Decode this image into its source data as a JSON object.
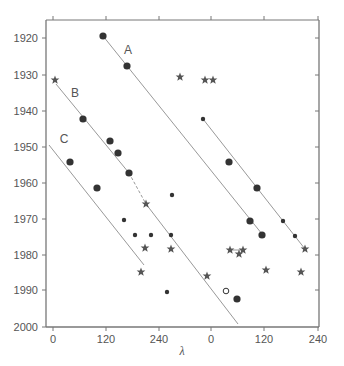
{
  "chart_data": {
    "type": "scatter",
    "title": "",
    "xlabel": "λ",
    "ylabel": "",
    "x_tick_labels": [
      "0",
      "120",
      "240",
      "0",
      "120",
      "240"
    ],
    "y_tick_labels": [
      "1920",
      "1930",
      "1940",
      "1950",
      "1960",
      "1970",
      "1980",
      "1990",
      "2000"
    ],
    "ylim": [
      2000,
      1915
    ],
    "y_inverted": true,
    "grid": false,
    "legend": null,
    "annotations": [
      "A",
      "B",
      "C"
    ],
    "frame": {
      "left": 46,
      "right": 319,
      "top": 20,
      "bottom": 327
    },
    "x_ticks_px": [
      53,
      106,
      159,
      211,
      264,
      318
    ],
    "y_ticks_px": [
      38,
      75,
      111,
      147,
      183,
      219,
      255,
      290,
      327
    ],
    "lines": [
      {
        "name": "A",
        "points_px": [
          [
            103,
            36
          ],
          [
            262,
            234
          ]
        ],
        "style": "solid"
      },
      {
        "name": "B",
        "points_px": [
          [
            56,
            84
          ],
          [
            129,
            173
          ]
        ],
        "style": "solid"
      },
      {
        "name": "B-dashed",
        "points_px": [
          [
            129,
            173
          ],
          [
            146,
            204
          ]
        ],
        "style": "dashed"
      },
      {
        "name": "B-lower",
        "points_px": [
          [
            146,
            204
          ],
          [
            238,
            324
          ]
        ],
        "style": "solid"
      },
      {
        "name": "C",
        "points_px": [
          [
            49,
            145
          ],
          [
            144,
            265
          ]
        ],
        "style": "solid"
      },
      {
        "name": "D",
        "points_px": [
          [
            203,
            119
          ],
          [
            305,
            249
          ]
        ],
        "style": "solid"
      },
      {
        "name": "star-link",
        "points_px": [
          [
            230,
            250
          ],
          [
            245,
            250
          ]
        ],
        "style": "solid"
      }
    ],
    "markers": [
      {
        "series": "A",
        "shape": "dot-large",
        "px": [
          103,
          36
        ],
        "year": 1919.5
      },
      {
        "series": "A",
        "shape": "dot-large",
        "px": [
          127,
          66
        ],
        "year": 1927.8
      },
      {
        "series": "A",
        "shape": "dot-large",
        "px": [
          250,
          221
        ],
        "year": 1970.7
      },
      {
        "series": "A",
        "shape": "dot-large",
        "px": [
          262,
          235
        ],
        "year": 1974.5
      },
      {
        "series": "B",
        "shape": "star",
        "px": [
          55,
          80
        ],
        "year": 1931.5
      },
      {
        "series": "B",
        "shape": "dot-large",
        "px": [
          83,
          119
        ],
        "year": 1942.3
      },
      {
        "series": "B",
        "shape": "dot-large",
        "px": [
          110,
          141
        ],
        "year": 1948.7
      },
      {
        "series": "B",
        "shape": "dot-large",
        "px": [
          118,
          153
        ],
        "year": 1951.9
      },
      {
        "series": "B",
        "shape": "dot-large",
        "px": [
          129,
          173
        ],
        "year": 1957.4
      },
      {
        "series": "B",
        "shape": "star",
        "px": [
          146,
          204
        ],
        "year": 1966
      },
      {
        "series": "B",
        "shape": "star",
        "px": [
          230,
          250
        ],
        "year": 1978.5
      },
      {
        "series": "B",
        "shape": "star",
        "px": [
          243,
          250
        ],
        "year": 1978.5
      },
      {
        "series": "B",
        "shape": "star",
        "px": [
          207,
          276
        ],
        "year": 1986
      },
      {
        "series": "B",
        "shape": "circle-open",
        "px": [
          226,
          291
        ],
        "year": 1990
      },
      {
        "series": "B",
        "shape": "dot-large",
        "px": [
          237,
          299
        ],
        "year": 1992.5
      },
      {
        "series": "C",
        "shape": "dot-large",
        "px": [
          70,
          162
        ],
        "year": 1954.4
      },
      {
        "series": "C",
        "shape": "dot-large",
        "px": [
          97,
          188
        ],
        "year": 1961.6
      },
      {
        "series": "C",
        "shape": "dot-small",
        "px": [
          124,
          220
        ],
        "year": 1970.4
      },
      {
        "series": "C",
        "shape": "dot-small",
        "px": [
          135,
          235
        ],
        "year": 1974.6
      },
      {
        "series": "C",
        "shape": "star",
        "px": [
          145,
          248
        ],
        "year": 1978.2
      },
      {
        "series": "other",
        "shape": "dot-small",
        "px": [
          151,
          235
        ],
        "year": 1974.6
      },
      {
        "series": "other",
        "shape": "dot-small",
        "px": [
          172,
          195
        ],
        "year": 1963.5
      },
      {
        "series": "other",
        "shape": "dot-small",
        "px": [
          171,
          235
        ],
        "year": 1974.6
      },
      {
        "series": "other",
        "shape": "star",
        "px": [
          171,
          249
        ],
        "year": 1978.5
      },
      {
        "series": "other",
        "shape": "star",
        "px": [
          141,
          272
        ],
        "year": 1985
      },
      {
        "series": "other",
        "shape": "dot-small",
        "px": [
          167,
          292
        ],
        "year": 1990.5
      },
      {
        "series": "other",
        "shape": "star",
        "px": [
          180,
          77
        ],
        "year": 1930.8
      },
      {
        "series": "other",
        "shape": "star",
        "px": [
          205,
          80
        ],
        "year": 1931.5
      },
      {
        "series": "other",
        "shape": "star",
        "px": [
          213,
          80
        ],
        "year": 1931.5
      },
      {
        "series": "D",
        "shape": "dot-small",
        "px": [
          203,
          119
        ],
        "year": 1942.5
      },
      {
        "series": "D",
        "shape": "dot-large",
        "px": [
          229,
          162
        ],
        "year": 1954.4
      },
      {
        "series": "D",
        "shape": "dot-large",
        "px": [
          257,
          188
        ],
        "year": 1961.6
      },
      {
        "series": "D",
        "shape": "dot-small",
        "px": [
          283,
          221
        ],
        "year": 1970.7
      },
      {
        "series": "D",
        "shape": "dot-small",
        "px": [
          295,
          236
        ],
        "year": 1974.8
      },
      {
        "series": "D",
        "shape": "star",
        "px": [
          305,
          249
        ],
        "year": 1978.5
      },
      {
        "series": "other",
        "shape": "star",
        "px": [
          239,
          254
        ],
        "year": 1980
      },
      {
        "series": "other",
        "shape": "star",
        "px": [
          266,
          270
        ],
        "year": 1984.5
      },
      {
        "series": "other",
        "shape": "star",
        "px": [
          301,
          272
        ],
        "year": 1985
      }
    ],
    "label_positions": {
      "A": [
        128,
        50
      ],
      "B": [
        75,
        93
      ],
      "C": [
        64,
        139
      ]
    }
  }
}
